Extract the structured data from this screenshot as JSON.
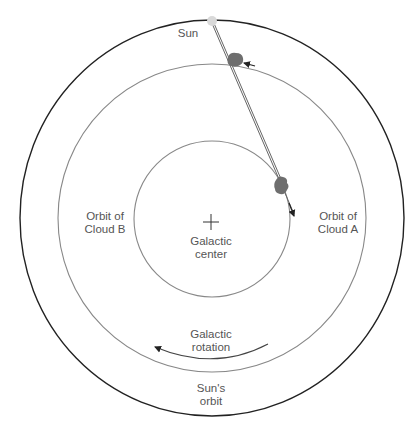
{
  "diagram": {
    "labels": {
      "sun": "Sun",
      "orbit_b_line1": "Orbit of",
      "orbit_b_line2": "Cloud B",
      "orbit_a_line1": "Orbit of",
      "orbit_a_line2": "Cloud A",
      "center_line1": "Galactic",
      "center_line2": "center",
      "rotation_line1": "Galactic",
      "rotation_line2": "rotation",
      "sun_orbit_line1": "Sun's",
      "sun_orbit_line2": "orbit"
    },
    "colors": {
      "outer_orbit": "#222222",
      "inner_orbits": "#888888",
      "cloud": "#6e6e6e",
      "sun": "#d9d9d9",
      "text": "#555555"
    },
    "icons": {
      "galactic_center": "plus-cross",
      "rotation_direction": "counterclockwise-arrow"
    }
  }
}
